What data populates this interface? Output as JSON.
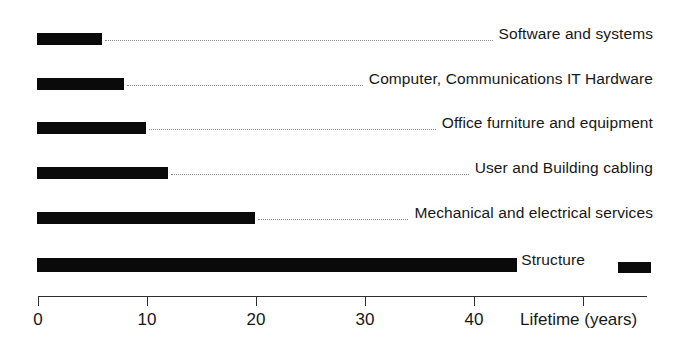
{
  "chart_data": {
    "type": "bar",
    "orientation": "horizontal",
    "title": "",
    "subtitle": "",
    "xlabel": "Lifetime (years)",
    "ylabel": "",
    "xlim": [
      0,
      55.8
    ],
    "xticks": [
      0,
      10,
      20,
      30,
      40,
      50
    ],
    "xticklabels": [
      "0",
      "10",
      "20",
      "30",
      "40",
      ""
    ],
    "grid": false,
    "legend": {
      "position": "inline-right",
      "entries": [
        {
          "label": "Structure",
          "color": "#0a0a0a"
        }
      ]
    },
    "bar_color": "#0a0a0a",
    "leader_line_style": "dotted",
    "categories": [
      "Software and systems",
      "Computer, Communications IT Hardware",
      "Office furniture and equipment",
      "User and Building cabling",
      "Mechanical and electrical services",
      "Structure"
    ],
    "values": [
      6,
      8,
      10,
      12,
      20,
      44
    ],
    "units": "years",
    "points": [
      {
        "category": "Software and systems",
        "value": 6
      },
      {
        "category": "Computer, Communications IT Hardware",
        "value": 8
      },
      {
        "category": "Office furniture and equipment",
        "value": 10
      },
      {
        "category": "User and Building cabling",
        "value": 12
      },
      {
        "category": "Mechanical and electrical services",
        "value": 20
      },
      {
        "category": "Structure",
        "value": 44
      }
    ]
  },
  "axis": {
    "title": "Lifetime (years)",
    "ticks": [
      {
        "value": 0,
        "label": "0"
      },
      {
        "value": 10,
        "label": "10"
      },
      {
        "value": 20,
        "label": "20"
      },
      {
        "value": 30,
        "label": "30"
      },
      {
        "value": 40,
        "label": "40"
      },
      {
        "value": 50,
        "label": ""
      }
    ]
  },
  "rows": [
    {
      "label": "Software and systems",
      "value": 6
    },
    {
      "label": "Computer, Communications IT Hardware",
      "value": 8
    },
    {
      "label": "Office furniture and equipment",
      "value": 10
    },
    {
      "label": "User and Building cabling",
      "value": 12
    },
    {
      "label": "Mechanical and electrical services",
      "value": 20
    },
    {
      "label": "Structure",
      "value": 44
    }
  ],
  "legend": {
    "structure_label": "Structure"
  },
  "colors": {
    "bar": "#0a0a0a",
    "axis": "#2e2e2e",
    "leader": "#8c8c8c",
    "text": "#171717",
    "background": "#ffffff"
  }
}
